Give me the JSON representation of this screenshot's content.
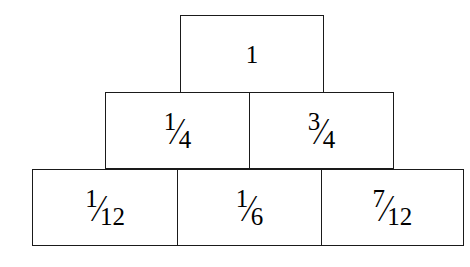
{
  "diagram": {
    "type": "nested-box-pyramid",
    "background_color": "#ffffff",
    "line_color": "#1a1a1a",
    "text_color": "#000000",
    "rows": [
      {
        "name": "top-row",
        "cells": [
          {
            "name": "cell-whole",
            "kind": "whole",
            "text": "1",
            "numerator": "",
            "slash": "",
            "denominator": ""
          }
        ]
      },
      {
        "name": "middle-row",
        "cells": [
          {
            "name": "cell-one-quarter",
            "kind": "fraction",
            "text": "1/4",
            "numerator": "1",
            "slash": "⁄",
            "denominator": "4"
          },
          {
            "name": "cell-three-quarters",
            "kind": "fraction",
            "text": "3/4",
            "numerator": "3",
            "slash": "⁄",
            "denominator": "4"
          }
        ]
      },
      {
        "name": "bottom-row",
        "cells": [
          {
            "name": "cell-one-twelfth",
            "kind": "fraction",
            "text": "1/12",
            "numerator": "1",
            "slash": "⁄",
            "denominator": "12"
          },
          {
            "name": "cell-one-sixth",
            "kind": "fraction",
            "text": "1/6",
            "numerator": "1",
            "slash": "⁄",
            "denominator": "6"
          },
          {
            "name": "cell-seven-twelfths",
            "kind": "fraction",
            "text": "7/12",
            "numerator": "7",
            "slash": "⁄",
            "denominator": "12"
          }
        ]
      }
    ]
  }
}
